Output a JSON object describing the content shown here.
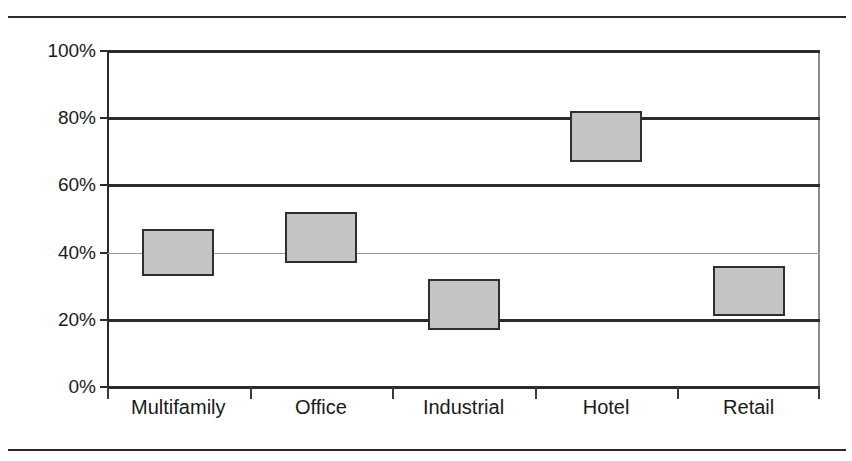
{
  "figure": {
    "title_remnant": "",
    "background_color": "#ffffff"
  },
  "chart_data": {
    "type": "bar",
    "subtype": "floating-range-bar",
    "title": "",
    "subtitle": "",
    "xlabel": "",
    "ylabel": "",
    "categories": [
      "Multifamily",
      "Office",
      "Industrial",
      "Hotel",
      "Retail"
    ],
    "low": [
      33,
      37,
      17,
      67,
      21
    ],
    "high": [
      47,
      52,
      32,
      82,
      36
    ],
    "series": [
      {
        "name": "Range low",
        "values": [
          33,
          37,
          17,
          67,
          21
        ]
      },
      {
        "name": "Range high",
        "values": [
          47,
          52,
          32,
          82,
          36
        ]
      }
    ],
    "ylim": [
      0,
      100
    ],
    "yticks": [
      0,
      20,
      40,
      60,
      80,
      100
    ],
    "ytick_labels": [
      "0%",
      "20%",
      "40%",
      "60%",
      "80%",
      "100%"
    ],
    "grid": true,
    "gridline_style": [
      "axis",
      "thick",
      "thin",
      "thick",
      "thick",
      "thick"
    ],
    "legend": null,
    "legend_position": "none",
    "annotations": [],
    "box_fill_color": "#c4c4c4",
    "box_border_color": "#2f2f2f",
    "gridline_color": "#2b2b2b",
    "text_color": "#1a1a1a"
  },
  "axis": {
    "y_ticks": [
      {
        "label": "100%",
        "value": 100
      },
      {
        "label": "80%",
        "value": 80
      },
      {
        "label": "60%",
        "value": 60
      },
      {
        "label": "40%",
        "value": 40
      },
      {
        "label": "20%",
        "value": 20
      },
      {
        "label": "0%",
        "value": 0
      }
    ],
    "x_categories": [
      {
        "label": "Multifamily"
      },
      {
        "label": "Office"
      },
      {
        "label": "Industrial"
      },
      {
        "label": "Hotel"
      },
      {
        "label": "Retail"
      }
    ]
  }
}
